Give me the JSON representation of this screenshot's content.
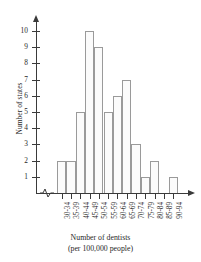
{
  "chart_data": {
    "type": "bar",
    "title": "",
    "subtitle": "",
    "xlabel": "Number of dentists",
    "xlabel_line2": "(per 100,000 people)",
    "ylabel": "Number of states",
    "categories": [
      "30-34",
      "35-39",
      "40-44",
      "45-49",
      "50-54",
      "55-59",
      "60-64",
      "65-69",
      "70-74",
      "75-79",
      "80-84",
      "85-89",
      "90-94"
    ],
    "values": [
      2,
      2,
      5,
      10,
      9,
      5,
      6,
      7,
      3,
      1,
      2,
      0,
      1
    ],
    "yticks": [
      1,
      2,
      3,
      4,
      5,
      6,
      7,
      8,
      9,
      10
    ],
    "ylim": [
      0,
      10
    ],
    "grid": false,
    "legend": false,
    "axis_break_x": true,
    "bar_fill": "#fbfbfb",
    "bar_stroke": "#9a9a9a",
    "axis_color": "#3a3a3a"
  }
}
